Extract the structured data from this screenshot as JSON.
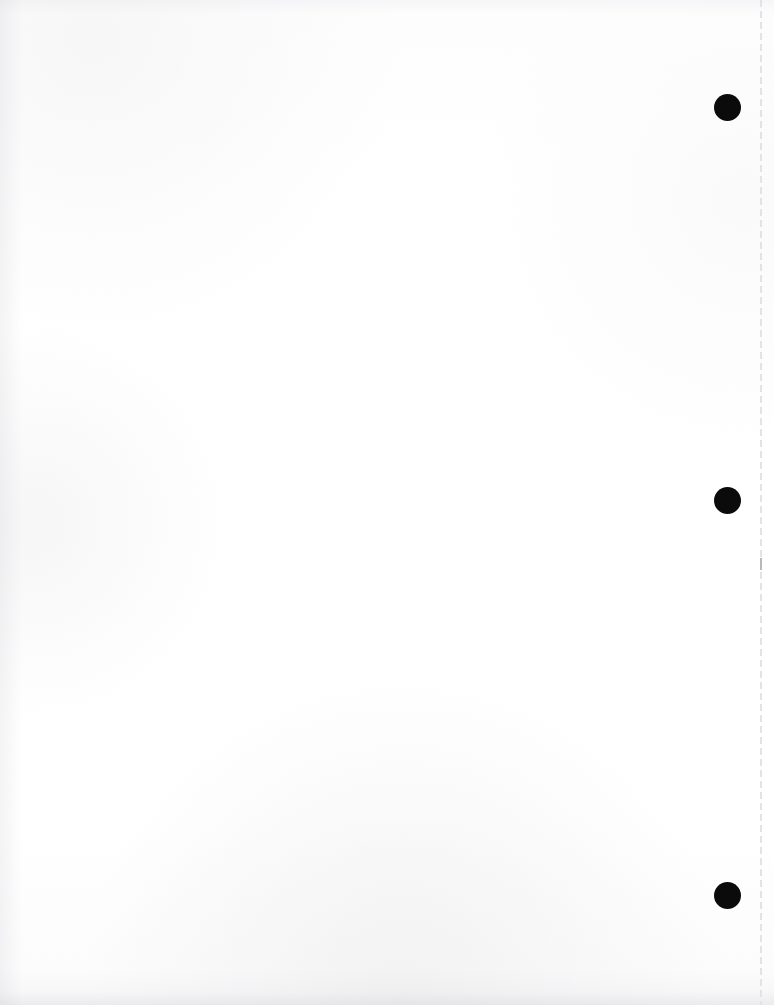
{
  "page": {
    "width_px": 774,
    "height_px": 1005,
    "background_color": "#ffffff",
    "paper_tone": "#fdfdfd",
    "body_text": "",
    "body_note": ""
  },
  "perforation": {
    "name": "vertical dashed tear line",
    "color": "#e3e3e5",
    "accent_color": "#b9b9bd",
    "x_position_px": 760,
    "dash_length_px": 7,
    "gap_length_px": 4,
    "label": ""
  },
  "holes": {
    "color": "#0b0b0b",
    "diameter_px": 27,
    "items": [
      {
        "name": "punch-hole-top",
        "x_px": 727,
        "y_px": 107,
        "label": ""
      },
      {
        "name": "punch-hole-middle",
        "x_px": 727,
        "y_px": 500,
        "label": ""
      },
      {
        "name": "punch-hole-bottom",
        "x_px": 727,
        "y_px": 895,
        "label": ""
      }
    ]
  },
  "ghost_text": {
    "note": "",
    "lines": [
      {
        "text": "",
        "label": ""
      },
      {
        "text": "",
        "label": ""
      },
      {
        "text": "",
        "label": ""
      },
      {
        "text": "",
        "label": ""
      }
    ]
  }
}
